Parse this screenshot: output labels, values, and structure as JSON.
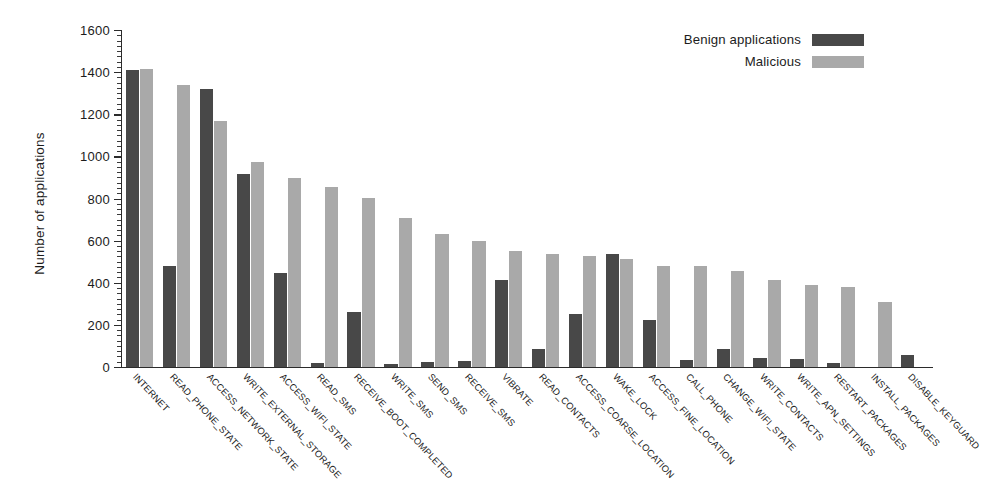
{
  "chart_data": {
    "type": "bar",
    "title": "",
    "xlabel": "",
    "ylabel": "Number of applications",
    "ylim": [
      0,
      1600
    ],
    "ytick_labels": [
      "0",
      "200",
      "400",
      "600",
      "800",
      "1000",
      "1200",
      "1400",
      "1600"
    ],
    "ytick_values": [
      0,
      200,
      400,
      600,
      800,
      1000,
      1200,
      1400,
      1600
    ],
    "minor_tick_step": 25,
    "grid": false,
    "legend_position": "top-right",
    "categories": [
      "INTERNET",
      "READ_PHONE_STATE",
      "ACCESS_NETWORK_STATE",
      "WRITE_EXTERNAL_STORAGE",
      "ACCESS_WIFI_STATE",
      "READ_SMS",
      "RECEIVE_BOOT_COMPLETED",
      "WRITE_SMS",
      "SEND_SMS",
      "RECEIVE_SMS",
      "VIBRATE",
      "READ_CONTACTS",
      "ACCESS_COARSE_LOCATION",
      "WAKE_LOCK",
      "ACCESS_FINE_LOCATION",
      "CALL_PHONE",
      "CHANGE_WIFI_STATE",
      "WRITE_CONTACTS",
      "WRITE_APN_SETTINGS",
      "RESTART_PACKAGES",
      "INSTALL_PACKAGES",
      "DISABLE_KEYGUARD"
    ],
    "series": [
      {
        "name": "Benign applications",
        "color": "#484848",
        "values": [
          1412,
          478,
          1322,
          915,
          447,
          20,
          260,
          12,
          25,
          28,
          415,
          85,
          253,
          538,
          222,
          35,
          85,
          45,
          38,
          20,
          0,
          55
        ]
      },
      {
        "name": "Malicious",
        "color": "#a9a9a9",
        "values": [
          1413,
          1338,
          1168,
          972,
          897,
          855,
          803,
          708,
          632,
          597,
          553,
          535,
          528,
          512,
          480,
          478,
          455,
          413,
          390,
          378,
          308,
          0
        ]
      }
    ]
  },
  "legend": {
    "entries": [
      {
        "label": "Benign applications",
        "color": "#484848"
      },
      {
        "label": "Malicious",
        "color": "#a9a9a9"
      }
    ]
  },
  "axes": {
    "y_title": "Number of applications"
  }
}
